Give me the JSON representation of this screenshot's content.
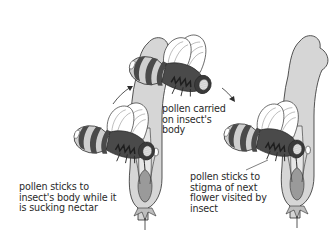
{
  "diagram": {
    "topic": "insect pollination",
    "stages": [
      {
        "id": "feeding",
        "caption_lines": [
          "pollen sticks to",
          "insect's body while it",
          "is sucking nectar"
        ]
      },
      {
        "id": "flying",
        "caption_lines": [
          "pollen carried",
          "on insect's",
          "body"
        ]
      },
      {
        "id": "pollinating",
        "caption_lines": [
          "pollen sticks to",
          "stigma of next",
          "flower visited by",
          "insect"
        ]
      }
    ],
    "arrows": [
      {
        "from": "feeding",
        "to": "flying"
      },
      {
        "from": "flying",
        "to": "pollinating"
      }
    ],
    "colors": {
      "outline": "#2b2b2b",
      "bee_dark": "#4a4a4a",
      "bee_light": "#cfcfcf",
      "petal": "#d9d9d9",
      "petal_dark": "#bdbdbd",
      "wing": "#ffffff",
      "background": "#ffffff"
    }
  }
}
